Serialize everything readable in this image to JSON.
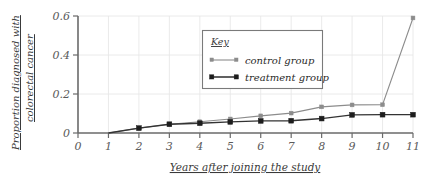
{
  "chart_data": {
    "type": "line",
    "title": "",
    "subtitle": "",
    "xlabel": "Years after joining the study",
    "ylabel": "Proportion diagnosed with colorectal cancer",
    "ylabel_line1": "Proportion diagnosed with",
    "ylabel_line2": "colorectal cancer",
    "x": [
      0,
      1,
      2,
      3,
      4,
      5,
      6,
      7,
      8,
      9,
      10,
      11
    ],
    "xlim": [
      0,
      11
    ],
    "ylim": [
      0,
      0.6
    ],
    "xticks": [
      "0",
      "1",
      "2",
      "3",
      "4",
      "5",
      "6",
      "7",
      "8",
      "9",
      "10",
      "11"
    ],
    "yticks": [
      "0",
      "0.2",
      "0.4",
      "0.6"
    ],
    "ytick_values": [
      0,
      0.2,
      0.4,
      0.6
    ],
    "grid": true,
    "legend_position": "upper-center",
    "series": [
      {
        "name": "control group",
        "color": "#8c8c8c",
        "x": [
          1,
          2,
          3,
          4,
          5,
          6,
          7,
          8,
          9,
          10,
          11
        ],
        "values": [
          0,
          0.025,
          0.045,
          0.058,
          0.072,
          0.088,
          0.102,
          0.134,
          0.144,
          0.145,
          0.59
        ]
      },
      {
        "name": "treatment group",
        "color": "#1d1d1d",
        "x": [
          1,
          2,
          3,
          4,
          5,
          6,
          7,
          8,
          9,
          10,
          11
        ],
        "values": [
          0,
          0.025,
          0.045,
          0.05,
          0.057,
          0.062,
          0.063,
          0.074,
          0.093,
          0.094,
          0.094
        ]
      }
    ]
  },
  "legend": {
    "title": "Key",
    "entries": [
      {
        "label": "control group"
      },
      {
        "label": "treatment group"
      }
    ]
  }
}
